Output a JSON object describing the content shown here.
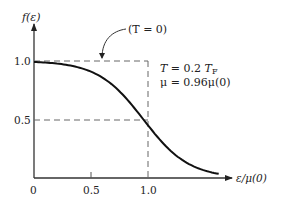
{
  "chart_data": {
    "type": "line",
    "title": "",
    "xlabel": "ε/μ(0)",
    "ylabel": "f(ε)",
    "xlim": [
      0,
      1.75
    ],
    "ylim": [
      0,
      1.15
    ],
    "grid": false,
    "x_ticks": [
      "0",
      "0.5",
      "1.0"
    ],
    "y_ticks": [
      "0.5",
      "1.0"
    ],
    "series": [
      {
        "name": "Fermi-Dirac distribution, T = 0.2 T_F",
        "formula": "f = 1 / (exp((ε - 0.96)/0.2) + 1)",
        "x": [
          0,
          0.2,
          0.4,
          0.6,
          0.8,
          0.96,
          1.0,
          1.2,
          1.4,
          1.6,
          1.63
        ],
        "y": [
          0.992,
          0.978,
          0.943,
          0.858,
          0.69,
          0.5,
          0.45,
          0.231,
          0.1,
          0.039,
          0.034
        ]
      },
      {
        "name": "T = 0 step function (dashed)",
        "x": [
          0,
          1.0,
          1.0
        ],
        "y": [
          1.0,
          1.0,
          0
        ]
      }
    ],
    "reference_lines": [
      {
        "orientation": "horizontal",
        "y": 0.5,
        "style": "dashed"
      },
      {
        "orientation": "horizontal",
        "y": 1.0,
        "style": "dashed"
      },
      {
        "orientation": "vertical",
        "x": 1.0,
        "style": "dashed"
      }
    ],
    "annotations": [
      {
        "text": "(T = 0)",
        "arrow_to": "dashed T=0 line at y=1.0"
      },
      {
        "text": "T = 0.2 T_F"
      },
      {
        "text": "μ = 0.96μ(0)"
      }
    ]
  },
  "labels": {
    "y_axis": "f(ε)",
    "x_axis": "ε/μ(0)",
    "x_tick_0": "0",
    "x_tick_05": "0.5",
    "x_tick_10": "1.0",
    "y_tick_05": "0.5",
    "y_tick_10": "1.0",
    "t0_note": "(T = 0)",
    "temp_note_T": "T",
    "temp_note_eq": " = 0.2 ",
    "temp_note_TF": "T",
    "temp_note_F": "F",
    "mu_note": "μ = 0.96μ(0)"
  }
}
